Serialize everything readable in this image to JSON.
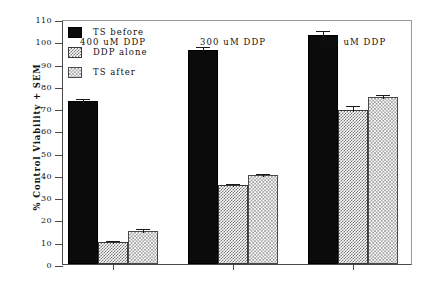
{
  "chart_data": {
    "type": "bar",
    "title": "",
    "xlabel": "",
    "ylabel": "% Control Viability + SEM",
    "ylim": [
      0,
      110
    ],
    "yticks": [
      0,
      10,
      20,
      30,
      40,
      50,
      60,
      70,
      80,
      90,
      100,
      110
    ],
    "ytick_labels": [
      "0",
      "10",
      "20",
      "30",
      "40",
      "50",
      "60",
      "70",
      "80",
      "90",
      "100",
      "110"
    ],
    "grid": false,
    "legend_position": "upper-left-inside",
    "categories": [
      "400 uM DDP",
      "300 uM DDP",
      "200 uM DDP"
    ],
    "series": [
      {
        "name": "TS before",
        "fill": "solid-black",
        "color": "#0b0b0b",
        "values": [
          73,
          96,
          103
        ],
        "errors": [
          2.0,
          2.5,
          2.5
        ]
      },
      {
        "name": "DDP alone",
        "fill": "checker-gray",
        "color": "#777777",
        "values": [
          10,
          35.5,
          69
        ],
        "errors": [
          1.2,
          1.2,
          3.0
        ]
      },
      {
        "name": "TS after",
        "fill": "hatch-light-gray",
        "color": "#9a9a9a",
        "values": [
          15,
          40,
          75
        ],
        "errors": [
          1.5,
          1.2,
          1.8
        ]
      }
    ]
  }
}
